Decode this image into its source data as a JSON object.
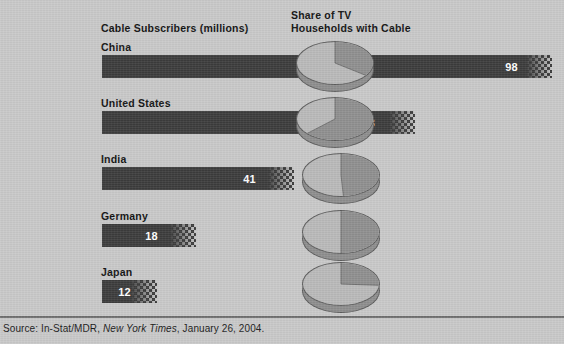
{
  "headers": {
    "left": "Cable Subscribers (millions)",
    "right": "Share of TV\nHouseholds with Cable"
  },
  "source": {
    "prefix": "Source: In-Stat/MDR, ",
    "publication": "New York Times",
    "suffix": ", January 26, 2004."
  },
  "colors": {
    "background": "#c9c9c9",
    "bar": "#3c3c3c",
    "pie_light": "#b9b9b9",
    "pie_dark": "#8f8f8f",
    "pie_side": "#8e8e8e",
    "outline": "#5d5d5d",
    "text": "#121212",
    "value_text": "#ffffff",
    "rule": "#6f6f6f"
  },
  "chart_data": {
    "type": "bar",
    "title": "",
    "xlabel": "",
    "ylabel": "",
    "categories": [
      "China",
      "United States",
      "India",
      "Germany",
      "Japan"
    ],
    "series": [
      {
        "name": "Cable Subscribers (millions)",
        "type": "bar",
        "values": [
          98,
          68,
          41,
          18,
          12
        ],
        "labels": [
          "98",
          "68",
          "41",
          "18",
          "12"
        ]
      },
      {
        "name": "Share of TV Households with Cable",
        "type": "pie",
        "values": [
          35,
          63,
          49,
          50,
          26
        ],
        "labels": [
          "35%",
          "63%",
          "49%",
          "50%",
          "26%"
        ]
      }
    ],
    "xlim": [
      0,
      100
    ],
    "grid": false,
    "legend": "none"
  },
  "rows": [
    {
      "country": "China",
      "bar_value": "98",
      "bar_px": 450,
      "pct_label": "35%",
      "pct": 35,
      "label_y": 41,
      "bar_y": 55,
      "pie_left": 296,
      "pie_top": 41,
      "pct_left": 326,
      "pct_top": 59,
      "value_right": 34
    },
    {
      "country": "United States",
      "bar_value": "68",
      "bar_px": 313,
      "pct_label": "63%",
      "pct": 63,
      "label_y": 97,
      "bar_y": 111,
      "pie_left": 296,
      "pie_top": 97,
      "pct_left": 327,
      "pct_top": 115,
      "value_right": 40
    },
    {
      "country": "India",
      "bar_value": "41",
      "bar_px": 192,
      "pct_label": "49%",
      "pct": 49,
      "label_y": 153,
      "bar_y": 167,
      "pie_left": 302,
      "pie_top": 153,
      "pct_left": 333,
      "pct_top": 171,
      "value_right": 38
    },
    {
      "country": "Germany",
      "bar_value": "18",
      "bar_px": 94,
      "pct_label": "50%",
      "pct": 50,
      "label_y": 210,
      "bar_y": 224,
      "pie_left": 302,
      "pie_top": 210,
      "pct_left": 333,
      "pct_top": 228,
      "value_right": 38
    },
    {
      "country": "Japan",
      "bar_value": "12",
      "bar_px": 55,
      "pct_label": "26%",
      "pct": 26,
      "label_y": 266,
      "bar_y": 280,
      "pie_left": 302,
      "pie_top": 262,
      "pct_left": 331,
      "pct_top": 281,
      "value_right": 26
    }
  ]
}
